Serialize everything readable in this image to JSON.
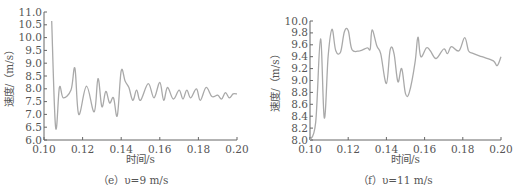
{
  "chart_data": [
    {
      "id": "e",
      "type": "line",
      "caption": "（e）υ=9 m/s",
      "xlabel": "时间/s",
      "ylabel": "速度/（m/s）",
      "xlim": [
        0.1,
        0.2
      ],
      "ylim": [
        6.0,
        11.0
      ],
      "xticks": [
        "0.10",
        "0.12",
        "0.14",
        "0.16",
        "0.18",
        "0.20"
      ],
      "yticks": [
        "6.0",
        "6.5",
        "7.0",
        "7.5",
        "8.0",
        "8.5",
        "9.0",
        "9.5",
        "10.0",
        "10.5",
        "11.0"
      ],
      "grid": false,
      "line_color": "#a9a9a9",
      "series": [
        {
          "name": "velocity",
          "x": [
            0.104,
            0.106,
            0.108,
            0.11,
            0.114,
            0.116,
            0.118,
            0.122,
            0.126,
            0.128,
            0.13,
            0.132,
            0.134,
            0.136,
            0.138,
            0.14,
            0.142,
            0.144,
            0.146,
            0.148,
            0.15,
            0.154,
            0.157,
            0.16,
            0.162,
            0.164,
            0.167,
            0.17,
            0.172,
            0.174,
            0.176,
            0.179,
            0.181,
            0.184,
            0.187,
            0.19,
            0.192,
            0.194,
            0.196,
            0.198,
            0.2
          ],
          "y": [
            10.65,
            6.5,
            8.05,
            7.65,
            7.95,
            8.8,
            7.0,
            8.1,
            7.1,
            8.4,
            7.3,
            7.9,
            7.45,
            7.65,
            6.95,
            8.7,
            8.3,
            8.05,
            7.55,
            7.95,
            7.55,
            8.2,
            7.65,
            8.25,
            7.55,
            8.05,
            7.6,
            7.95,
            7.6,
            7.95,
            7.65,
            8.0,
            7.55,
            8.05,
            7.7,
            7.75,
            7.6,
            7.85,
            7.65,
            7.8,
            7.8
          ]
        }
      ]
    },
    {
      "id": "f",
      "type": "line",
      "caption": "（f）υ=11 m/s",
      "xlabel": "时间/s",
      "ylabel": "速度/（m/s）",
      "xlim": [
        0.1,
        0.2
      ],
      "ylim": [
        8.0,
        10.0
      ],
      "xticks": [
        "0.10",
        "0.12",
        "0.14",
        "0.16",
        "0.18",
        "0.20"
      ],
      "yticks": [
        "8.0",
        "8.2",
        "8.4",
        "8.6",
        "8.8",
        "9.0",
        "9.2",
        "9.4",
        "9.6",
        "9.8",
        "10.0"
      ],
      "grid": false,
      "line_color": "#a9a9a9",
      "series": [
        {
          "name": "velocity",
          "x": [
            0.1,
            0.103,
            0.1055,
            0.1075,
            0.1095,
            0.1115,
            0.1135,
            0.116,
            0.118,
            0.12,
            0.122,
            0.126,
            0.13,
            0.1315,
            0.1325,
            0.135,
            0.137,
            0.14,
            0.142,
            0.144,
            0.146,
            0.148,
            0.15,
            0.152,
            0.155,
            0.1565,
            0.158,
            0.161,
            0.163,
            0.166,
            0.17,
            0.172,
            0.174,
            0.178,
            0.181,
            0.183,
            0.185,
            0.19,
            0.196,
            0.198,
            0.2
          ],
          "y": [
            8.0,
            8.3,
            9.7,
            8.37,
            9.4,
            9.86,
            9.5,
            9.48,
            9.82,
            9.84,
            9.52,
            9.5,
            9.55,
            9.53,
            9.85,
            9.58,
            9.45,
            8.95,
            9.52,
            9.45,
            8.98,
            9.2,
            8.78,
            8.8,
            9.3,
            9.73,
            9.4,
            9.55,
            9.5,
            9.37,
            9.53,
            9.45,
            9.57,
            9.5,
            9.72,
            9.5,
            9.46,
            9.4,
            9.33,
            9.25,
            9.4
          ]
        }
      ]
    }
  ]
}
